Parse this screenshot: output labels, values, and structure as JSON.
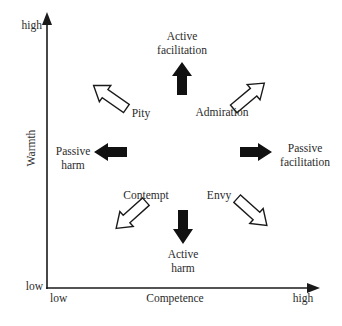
{
  "diagram": {
    "type": "two-dimensional stereotype map",
    "axes": {
      "y": {
        "label": "Warmth",
        "low": "low",
        "high": "high"
      },
      "x": {
        "label": "Competence",
        "low": "low",
        "high": "high"
      }
    },
    "emotions": [
      {
        "id": "admiration",
        "label": "Admiration",
        "direction": "up-right",
        "style": "hollow"
      },
      {
        "id": "envy",
        "label": "Envy",
        "direction": "down-right",
        "style": "hollow"
      },
      {
        "id": "contempt",
        "label": "Contempt",
        "direction": "down-left",
        "style": "hollow"
      },
      {
        "id": "pity",
        "label": "Pity",
        "direction": "up-left",
        "style": "hollow"
      }
    ],
    "behaviors": [
      {
        "id": "active-facilitation",
        "line1": "Active",
        "line2": "facilitation",
        "direction": "up",
        "style": "solid"
      },
      {
        "id": "passive-facilitation",
        "line1": "Passive",
        "line2": "facilitation",
        "direction": "right",
        "style": "solid"
      },
      {
        "id": "active-harm",
        "line1": "Active",
        "line2": "harm",
        "direction": "down",
        "style": "solid"
      },
      {
        "id": "passive-harm",
        "line1": "Passive",
        "line2": "harm",
        "direction": "left",
        "style": "solid"
      }
    ],
    "colors": {
      "ink": "#1a1a1a",
      "text": "#2b2b2b",
      "background": "#ffffff"
    }
  }
}
